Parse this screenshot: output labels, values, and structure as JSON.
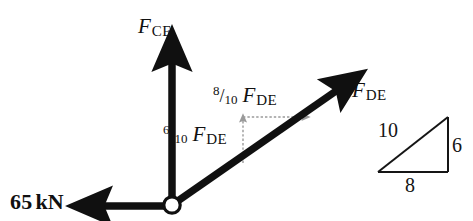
{
  "figure": {
    "name": "joint-free-body-diagram",
    "background_color": "#ffffff",
    "vector_color": "#101010",
    "component_color": "#9a9a9a",
    "triangle_color": "#151515"
  },
  "labels": {
    "f_ce": {
      "symbol": "F",
      "subscript": "CE"
    },
    "f_de": {
      "symbol": "F",
      "subscript": "DE"
    },
    "component_y": {
      "numerator": "6",
      "slash": "/",
      "denominator": "10",
      "symbol": "F",
      "subscript": "DE"
    },
    "component_x": {
      "numerator": "8",
      "slash": "/",
      "denominator": "10",
      "symbol": "F",
      "subscript": "DE"
    },
    "applied_load": {
      "value": "65",
      "unit": "kN"
    }
  },
  "slope_triangle": {
    "hypotenuse": "10",
    "vertical": "6",
    "base": "8"
  },
  "geometry": {
    "joint": {
      "x": 172,
      "y": 205
    },
    "vertical_vector_tip": {
      "x": 172,
      "y": 55
    },
    "diagonal_vector_tip": {
      "x": 345,
      "y": 85
    },
    "horizontal_vector_tip": {
      "x": 95,
      "y": 207
    },
    "component_corner": {
      "x": 243,
      "y": 117
    },
    "component_y_base": {
      "x": 243,
      "y": 163
    },
    "component_x_tip": {
      "x": 307,
      "y": 117
    },
    "triangle": {
      "left": {
        "x": 378,
        "y": 172
      },
      "right": {
        "x": 448,
        "y": 172
      },
      "top": {
        "x": 448,
        "y": 117
      }
    }
  }
}
